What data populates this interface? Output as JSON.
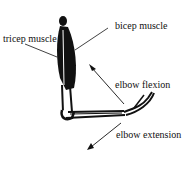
{
  "diagram": {
    "labels": {
      "tricep": "tricep muscle",
      "bicep": "bicep muscle",
      "flexion": "elbow flexion",
      "extension": "elbow extension"
    },
    "colors": {
      "ink": "#111111",
      "background": "#ffffff"
    }
  }
}
